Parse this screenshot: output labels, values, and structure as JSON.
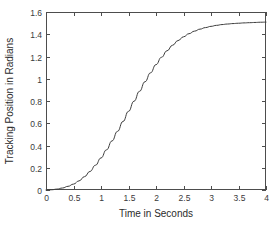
{
  "chart_data": {
    "type": "line",
    "title": "",
    "xlabel": "Time in Seconds",
    "ylabel": "Tracking Position in Radians",
    "xlim": [
      0,
      4
    ],
    "ylim": [
      0,
      1.6
    ],
    "grid": false,
    "legend": null,
    "xticks": [
      0,
      0.5,
      1,
      1.5,
      2,
      2.5,
      3,
      3.5,
      4
    ],
    "xtick_labels": [
      "0",
      "0.5",
      "1",
      "1.5",
      "2",
      "2.5",
      "3",
      "3.5",
      "4"
    ],
    "yticks": [
      0,
      0.2,
      0.4,
      0.6,
      0.8,
      1,
      1.2,
      1.4,
      1.6
    ],
    "ytick_labels": [
      "0",
      "0.2",
      "0.4",
      "0.6",
      "0.8",
      "1",
      "1.2",
      "1.4",
      "1.6"
    ],
    "line_color": "#3c3c3c",
    "series": [
      {
        "name": "Tracking Position",
        "x": [
          0,
          0.1,
          0.2,
          0.3,
          0.4,
          0.5,
          0.6,
          0.7,
          0.8,
          0.9,
          1.0,
          1.1,
          1.2,
          1.3,
          1.4,
          1.5,
          1.6,
          1.7,
          1.8,
          1.9,
          2.0,
          2.1,
          2.2,
          2.3,
          2.4,
          2.5,
          2.6,
          2.7,
          2.8,
          2.9,
          3.0,
          3.1,
          3.2,
          3.3,
          3.4,
          3.5,
          3.6,
          3.7,
          3.8,
          3.9,
          4.0
        ],
        "y": [
          0,
          0.002,
          0.008,
          0.018,
          0.033,
          0.053,
          0.082,
          0.12,
          0.167,
          0.223,
          0.288,
          0.361,
          0.441,
          0.527,
          0.616,
          0.707,
          0.798,
          0.887,
          0.973,
          1.053,
          1.127,
          1.193,
          1.251,
          1.301,
          1.343,
          1.377,
          1.405,
          1.428,
          1.446,
          1.46,
          1.471,
          1.48,
          1.487,
          1.492,
          1.496,
          1.499,
          1.502,
          1.504,
          1.506,
          1.508,
          1.509
        ]
      }
    ]
  },
  "plot_box": {
    "left": 46,
    "top": 12,
    "right": 266,
    "bottom": 190
  }
}
